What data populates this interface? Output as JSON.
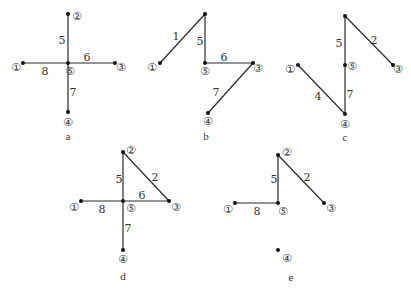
{
  "nodes_glyphs": {
    "1": "①",
    "2": "②",
    "3": "③",
    "4": "④",
    "5": "⑤"
  },
  "panels": [
    {
      "caption": "a",
      "nodes": [
        {
          "id": "2",
          "x": 68,
          "y": 14,
          "lx": 77,
          "ly": 20,
          "label": "②"
        },
        {
          "id": "5",
          "x": 68,
          "y": 63,
          "lx": 70,
          "ly": 75,
          "label": "⑤"
        },
        {
          "id": "1",
          "x": 23,
          "y": 63,
          "lx": 16,
          "ly": 71,
          "label": "①"
        },
        {
          "id": "3",
          "x": 115,
          "y": 63,
          "lx": 121,
          "ly": 71,
          "label": "③"
        },
        {
          "id": "4",
          "x": 68,
          "y": 112,
          "lx": 68,
          "ly": 126,
          "label": "④"
        }
      ],
      "edges": [
        {
          "from": "2",
          "to": "5",
          "weight": "5",
          "wx": 62,
          "wy": 44
        },
        {
          "from": "5",
          "to": "3",
          "weight": "6",
          "wx": 87,
          "wy": 61
        },
        {
          "from": "1",
          "to": "5",
          "weight": "8",
          "wx": 45,
          "wy": 75
        },
        {
          "from": "5",
          "to": "4",
          "weight": "7",
          "wx": 73,
          "wy": 96
        }
      ],
      "caption_pos": {
        "x": 68,
        "y": 140
      }
    },
    {
      "caption": "b",
      "nodes": [
        {
          "id": "2",
          "x": 205,
          "y": 14,
          "lx": 0,
          "ly": 0,
          "label": ""
        },
        {
          "id": "1",
          "x": 160,
          "y": 63,
          "lx": 152,
          "ly": 71,
          "label": "①"
        },
        {
          "id": "5",
          "x": 205,
          "y": 63,
          "lx": 205,
          "ly": 75,
          "label": "⑤"
        },
        {
          "id": "3",
          "x": 253,
          "y": 63,
          "lx": 258,
          "ly": 72,
          "label": "③"
        },
        {
          "id": "4",
          "x": 208,
          "y": 113,
          "lx": 208,
          "ly": 125,
          "label": "④"
        }
      ],
      "edges": [
        {
          "from": "2",
          "to": "1",
          "weight": "1",
          "wx": 176,
          "wy": 40
        },
        {
          "from": "2",
          "to": "5",
          "weight": "5",
          "wx": 200,
          "wy": 45
        },
        {
          "from": "5",
          "to": "3",
          "weight": "6",
          "wx": 224,
          "wy": 61
        },
        {
          "from": "3",
          "to": "4",
          "weight": "7",
          "wx": 216,
          "wy": 96
        }
      ],
      "caption_pos": {
        "x": 206,
        "y": 140
      }
    },
    {
      "caption": "c",
      "nodes": [
        {
          "id": "2",
          "x": 345,
          "y": 16,
          "lx": 0,
          "ly": 0,
          "label": ""
        },
        {
          "id": "3",
          "x": 393,
          "y": 65,
          "lx": 398,
          "ly": 73,
          "label": "③"
        },
        {
          "id": "5",
          "x": 345,
          "y": 65,
          "lx": 352,
          "ly": 70,
          "label": "⑤"
        },
        {
          "id": "1",
          "x": 298,
          "y": 65,
          "lx": 290,
          "ly": 73,
          "label": "①"
        },
        {
          "id": "4",
          "x": 345,
          "y": 114,
          "lx": 345,
          "ly": 128,
          "label": "④"
        }
      ],
      "edges": [
        {
          "from": "2",
          "to": "5",
          "weight": "5",
          "wx": 339,
          "wy": 47
        },
        {
          "from": "2",
          "to": "3",
          "weight": "2",
          "wx": 374,
          "wy": 44
        },
        {
          "from": "1",
          "to": "4",
          "weight": "4",
          "wx": 318,
          "wy": 100
        },
        {
          "from": "5",
          "to": "4",
          "weight": "7",
          "wx": 350,
          "wy": 98
        }
      ],
      "caption_pos": {
        "x": 345,
        "y": 141
      }
    },
    {
      "caption": "d",
      "nodes": [
        {
          "id": "2",
          "x": 123,
          "y": 152,
          "lx": 131,
          "ly": 154,
          "label": "②"
        },
        {
          "id": "5",
          "x": 123,
          "y": 201,
          "lx": 131,
          "ly": 212,
          "label": "⑤"
        },
        {
          "id": "1",
          "x": 81,
          "y": 201,
          "lx": 74,
          "ly": 211,
          "label": "①"
        },
        {
          "id": "3",
          "x": 169,
          "y": 201,
          "lx": 176,
          "ly": 211,
          "label": "③"
        },
        {
          "id": "4",
          "x": 123,
          "y": 250,
          "lx": 123,
          "ly": 263,
          "label": "④"
        }
      ],
      "edges": [
        {
          "from": "2",
          "to": "5",
          "weight": "5",
          "wx": 119,
          "wy": 183
        },
        {
          "from": "2",
          "to": "3",
          "weight": "2",
          "wx": 155,
          "wy": 181
        },
        {
          "from": "5",
          "to": "3",
          "weight": "6",
          "wx": 142,
          "wy": 199
        },
        {
          "from": "1",
          "to": "5",
          "weight": "8",
          "wx": 102,
          "wy": 213
        },
        {
          "from": "5",
          "to": "4",
          "weight": "7",
          "wx": 128,
          "wy": 232
        }
      ],
      "caption_pos": {
        "x": 123,
        "y": 280
      }
    },
    {
      "caption": "e",
      "nodes": [
        {
          "id": "2",
          "x": 278,
          "y": 155,
          "lx": 287,
          "ly": 156,
          "label": "②"
        },
        {
          "id": "5",
          "x": 278,
          "y": 203,
          "lx": 283,
          "ly": 215,
          "label": "⑤"
        },
        {
          "id": "1",
          "x": 235,
          "y": 203,
          "lx": 228,
          "ly": 213,
          "label": "①"
        },
        {
          "id": "3",
          "x": 324,
          "y": 203,
          "lx": 331,
          "ly": 212,
          "label": "③"
        },
        {
          "id": "4",
          "x": 278,
          "y": 250,
          "lx": 287,
          "ly": 262,
          "label": "④"
        }
      ],
      "edges": [
        {
          "from": "2",
          "to": "5",
          "weight": "5",
          "wx": 274,
          "wy": 183
        },
        {
          "from": "2",
          "to": "3",
          "weight": "2",
          "wx": 307,
          "wy": 181
        },
        {
          "from": "1",
          "to": "5",
          "weight": "8",
          "wx": 257,
          "wy": 215
        }
      ],
      "caption_pos": {
        "x": 291,
        "y": 281
      }
    }
  ]
}
